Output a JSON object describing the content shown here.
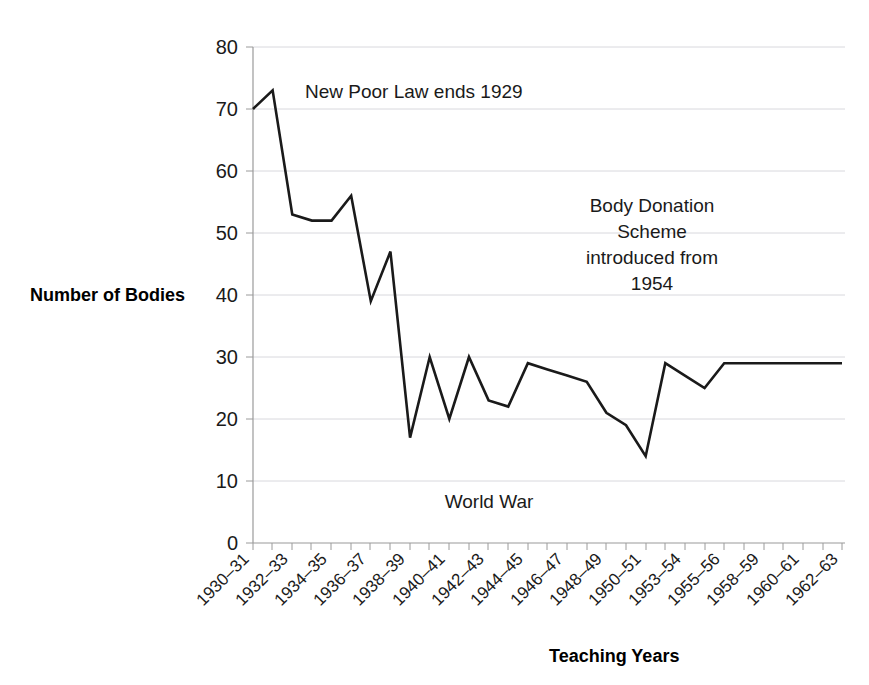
{
  "chart_data": {
    "type": "line",
    "title": "",
    "xlabel": "Teaching Years",
    "ylabel": "Number of Bodies",
    "ylim": [
      0,
      80
    ],
    "ytick_values": [
      0,
      10,
      20,
      30,
      40,
      50,
      60,
      70,
      80
    ],
    "ytick_labels": [
      "0",
      "10",
      "20",
      "30",
      "40",
      "50",
      "60",
      "70",
      "80"
    ],
    "grid": true,
    "legend": "none",
    "categories": [
      "1930-31",
      "1931-32",
      "1932-33",
      "1933-34",
      "1934-35",
      "1935-36",
      "1936-37",
      "1937-38",
      "1938-39",
      "1939-40",
      "1940-41",
      "1941-42",
      "1942-43",
      "1943-44",
      "1944-45",
      "1945-46",
      "1946-47",
      "1947-48",
      "1948-49",
      "1949-50",
      "1950-51",
      "1951-52",
      "1953-54",
      "1954-55",
      "1955-56",
      "1956-57",
      "1958-59",
      "1959-60",
      "1960-61",
      "1961-62",
      "1962-63"
    ],
    "xtick_labels": [
      "1930–31",
      "1932–33",
      "1934–35",
      "1936–37",
      "1938–39",
      "1940–41",
      "1942–43",
      "1944–45",
      "1946–47",
      "1948–49",
      "1950–51",
      "1953–54",
      "1955–56",
      "1958–59",
      "1960–61",
      "1962–63"
    ],
    "series": [
      {
        "name": "Number of Bodies",
        "values": [
          70,
          73,
          53,
          52,
          52,
          56,
          39,
          47,
          17,
          30,
          20,
          30,
          23,
          22,
          29,
          28,
          27,
          26,
          21,
          19,
          14,
          29,
          27,
          25,
          29,
          29,
          29,
          29,
          29,
          29,
          29
        ]
      }
    ],
    "annotations": [
      {
        "id": "new-poor-law",
        "text": "New Poor Law ends 1929",
        "lines": [
          "New Poor Law ends 1929"
        ]
      },
      {
        "id": "body-donation",
        "text": "Body Donation Scheme introduced from 1954",
        "lines": [
          "Body Donation",
          "Scheme",
          "introduced from",
          "1954"
        ]
      },
      {
        "id": "world-war",
        "text": "World War",
        "lines": [
          "World War"
        ]
      }
    ],
    "colors": {
      "line": "#1a1a1a",
      "grid": "#d8d8dd",
      "axis": "#9a9a9a",
      "background": "#ffffff",
      "text": "#1a1a1a"
    }
  },
  "ylabels": {
    "y0": "0",
    "y10": "10",
    "y20": "20",
    "y30": "30",
    "y40": "40",
    "y50": "50",
    "y60": "60",
    "y70": "70",
    "y80": "80"
  },
  "xlabels": {
    "t0": "1930–31",
    "t1": "1932–33",
    "t2": "1934–35",
    "t3": "1936–37",
    "t4": "1938–39",
    "t5": "1940–41",
    "t6": "1942–43",
    "t7": "1944–45",
    "t8": "1946–47",
    "t9": "1948–49",
    "t10": "1950–51",
    "t11": "1953–54",
    "t12": "1955–56",
    "t13": "1958–59",
    "t14": "1960–61",
    "t15": "1962–63"
  },
  "titles": {
    "y_axis": "Number of Bodies",
    "x_axis": "Teaching Years"
  },
  "annotation_text": {
    "poor_law": "New Poor Law ends 1929",
    "body_donation_l1": "Body Donation",
    "body_donation_l2": "Scheme",
    "body_donation_l3": "introduced from",
    "body_donation_l4": "1954",
    "world_war": "World War"
  }
}
